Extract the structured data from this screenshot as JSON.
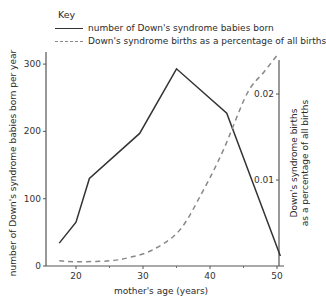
{
  "key": {
    "title": "Key",
    "items": [
      {
        "style": "solid",
        "label": "number of Down's syndrome babies born"
      },
      {
        "style": "dashed",
        "label": "Down's syndrome births as a percentage of all births"
      }
    ]
  },
  "axes": {
    "x_label": "mother's age (years)",
    "y_left_label": "number of Down's syndrome babies born per year",
    "y_right_label_line1": "Down's syndrome births",
    "y_right_label_line2": "as a percentage of all births",
    "x_ticks": [
      "20",
      "30",
      "40",
      "50"
    ],
    "y_left_ticks": [
      "0",
      "100",
      "200",
      "300"
    ],
    "y_right_ticks": [
      "0.01",
      "0.02"
    ]
  },
  "colors": {
    "solid_line": "#333333",
    "dashed_line": "#888888",
    "axis": "#555555"
  },
  "chart_data": {
    "type": "line",
    "title": "",
    "xlabel": "mother's age (years)",
    "ylabel": "number of Down's syndrome babies born per year",
    "y2label": "Down's syndrome births as a percentage of all births",
    "xlim": [
      15,
      51
    ],
    "ylim": [
      0,
      320
    ],
    "y2lim": [
      0,
      0.025
    ],
    "x_ticks": [
      20,
      30,
      40,
      50
    ],
    "y_ticks": [
      0,
      100,
      200,
      300
    ],
    "y2_ticks": [
      0.01,
      0.02
    ],
    "grid": false,
    "legend_position": "top",
    "series": [
      {
        "name": "number of Down's syndrome babies born",
        "axis": "left",
        "style": "solid",
        "x": [
          17.5,
          20,
          22,
          29.5,
          35,
          42.5,
          50.5
        ],
        "values": [
          34,
          65,
          130,
          197,
          293,
          227,
          15
        ]
      },
      {
        "name": "Down's syndrome births as a percentage of all births",
        "axis": "right",
        "style": "dashed",
        "x": [
          17.5,
          20,
          25,
          28,
          31.5,
          35.5,
          39,
          42,
          45.5,
          48,
          50
        ],
        "values": [
          0.0006,
          0.0005,
          0.0006,
          0.001,
          0.0019,
          0.0042,
          0.0088,
          0.0135,
          0.02,
          0.0225,
          0.0245
        ]
      }
    ]
  }
}
